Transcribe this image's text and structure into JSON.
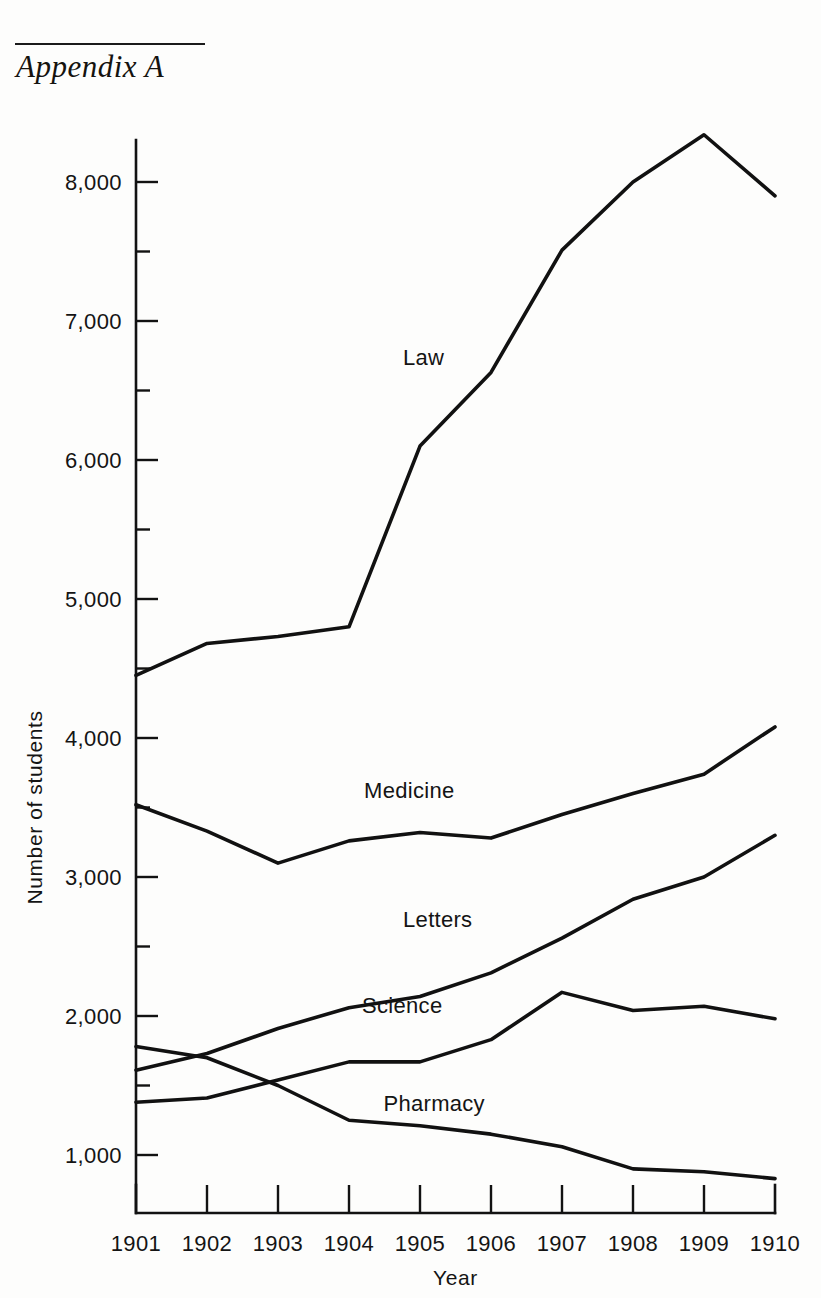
{
  "page": {
    "running_head": "Appendix A"
  },
  "chart_data": {
    "type": "line",
    "title": "",
    "xlabel": "Year",
    "ylabel": "Number of students",
    "x": [
      1901,
      1902,
      1903,
      1904,
      1905,
      1906,
      1907,
      1908,
      1909,
      1910
    ],
    "categories": [
      "1901",
      "1902",
      "1903",
      "1904",
      "1905",
      "1906",
      "1907",
      "1908",
      "1909",
      "1910"
    ],
    "xlim": [
      1901,
      1910
    ],
    "ylim": [
      500,
      8600
    ],
    "y_major_ticks": [
      1000,
      2000,
      3000,
      4000,
      5000,
      6000,
      7000,
      8000
    ],
    "y_major_tick_labels": [
      "1,000",
      "2,000",
      "3,000",
      "4,000",
      "5,000",
      "6,000",
      "7,000",
      "8,000"
    ],
    "y_minor_ticks": [
      1500,
      2500,
      3500,
      4500,
      5500,
      6500,
      7500
    ],
    "grid": false,
    "legend_position": "inline-labels",
    "series": [
      {
        "name": "Law",
        "label": "Law",
        "values": [
          4450,
          4680,
          4730,
          4800,
          6100,
          6630,
          7510,
          8000,
          8340,
          7900
        ],
        "label_x": 1905.05,
        "label_y": 6680
      },
      {
        "name": "Medicine",
        "label": "Medicine",
        "values": [
          3520,
          3330,
          3100,
          3260,
          3320,
          3280,
          3450,
          3600,
          3740,
          4080
        ],
        "label_x": 1904.85,
        "label_y": 3570
      },
      {
        "name": "Letters",
        "label": "Letters",
        "values": [
          1610,
          1730,
          1910,
          2060,
          2140,
          2310,
          2560,
          2840,
          3000,
          3300
        ],
        "label_x": 1905.25,
        "label_y": 2640
      },
      {
        "name": "Science",
        "label": "Science",
        "values": [
          1380,
          1410,
          1540,
          1670,
          1670,
          1830,
          2170,
          2040,
          2070,
          1980
        ],
        "label_x": 1904.75,
        "label_y": 2020
      },
      {
        "name": "Pharmacy",
        "label": "Pharmacy",
        "values": [
          1780,
          1700,
          1500,
          1250,
          1210,
          1150,
          1060,
          900,
          880,
          830
        ],
        "label_x": 1905.2,
        "label_y": 1320
      }
    ]
  }
}
